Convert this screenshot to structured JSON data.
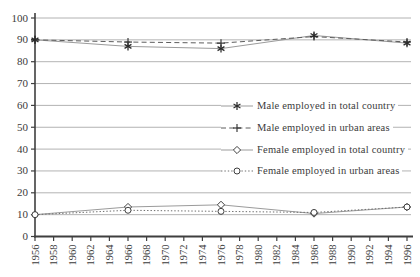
{
  "chart_data": {
    "type": "line",
    "x": [
      1956,
      1966,
      1976,
      1986,
      1996
    ],
    "x_ticks": [
      1956,
      1958,
      1960,
      1962,
      1964,
      1966,
      1968,
      1970,
      1972,
      1974,
      1976,
      1978,
      1980,
      1982,
      1984,
      1986,
      1988,
      1990,
      1992,
      1994,
      1996
    ],
    "y_ticks": [
      0,
      10,
      20,
      30,
      40,
      50,
      60,
      70,
      80,
      90,
      100
    ],
    "ylim": [
      0,
      100
    ],
    "title": "",
    "xlabel": "",
    "ylabel": "",
    "grid": "horizontal",
    "legend_position": "inside-right-center",
    "series": [
      {
        "name": "Male employed in total country",
        "marker": "asterisk",
        "line": "solid",
        "color": "#9b9b9b",
        "marker_color": "#2a2a2a",
        "values": [
          90,
          87,
          86,
          92,
          88.5
        ]
      },
      {
        "name": "Male employed in urban areas",
        "marker": "plus",
        "line": "dashed",
        "color": "#5d5d5d",
        "marker_color": "#2a2a2a",
        "values": [
          90,
          89,
          88.5,
          91.5,
          89
        ]
      },
      {
        "name": "Female employed in total country",
        "marker": "diamond",
        "line": "solid",
        "color": "#9b9b9b",
        "marker_color": "#3f3f3f",
        "values": [
          10,
          13.5,
          14.5,
          10.5,
          13.5
        ]
      },
      {
        "name": "Female employed in urban areas",
        "marker": "circle",
        "line": "dotted",
        "color": "#6e6e6e",
        "marker_color": "#3f3f3f",
        "values": [
          10,
          12,
          11.5,
          11,
          13.5
        ]
      }
    ],
    "colors": {
      "axis": "#3f3f3f",
      "grid": "#9f9f9f",
      "text": "#3b3b3b",
      "background": "#ffffff"
    }
  }
}
